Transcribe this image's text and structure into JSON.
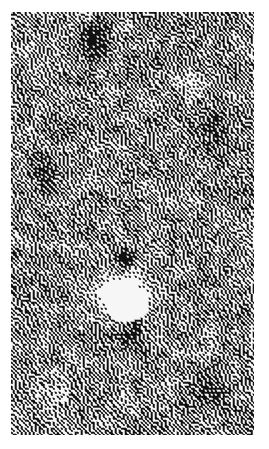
{
  "page": {
    "width": 269,
    "height": 449,
    "background_color": "#ffffff"
  },
  "plate": {
    "name": "dithered-grayscale-field",
    "x": 11,
    "y": 12,
    "width": 243,
    "height": 423,
    "description": "Coarsely dithered black-and-white halftone rendering of a noisy grayscale field",
    "ink_color": "#000000",
    "paper_color": "#ffffff",
    "dither_cell_px": 2,
    "base_level": 0.52,
    "noise": {
      "type": "value-noise",
      "octaves": 4,
      "base_scale_px": 9,
      "amplitude": 0.3,
      "grain_amplitude": 0.17,
      "seed": 20240517
    },
    "features": [
      {
        "name": "bright-source",
        "kind": "bright-blob",
        "center_x": 122,
        "center_y": 296,
        "radius_x": 23,
        "radius_y": 18,
        "core_radius_x": 15,
        "core_radius_y": 12,
        "peak_level": 1.0,
        "halo_radius": 62,
        "halo_strength": 0.26
      },
      {
        "name": "dark-streak-above-source",
        "kind": "dark-blob",
        "center_x": 124,
        "center_y": 258,
        "radius_x": 13,
        "radius_y": 11,
        "peak_level": -0.62
      },
      {
        "name": "dark-patch-upper-center",
        "kind": "dark-blob",
        "center_x": 96,
        "center_y": 40,
        "radius_x": 18,
        "radius_y": 20,
        "peak_level": -0.48
      },
      {
        "name": "dark-patch-upper-right",
        "kind": "dark-blob",
        "center_x": 212,
        "center_y": 128,
        "radius_x": 20,
        "radius_y": 22,
        "peak_level": -0.34
      },
      {
        "name": "dark-patch-left-mid",
        "kind": "dark-blob",
        "center_x": 40,
        "center_y": 176,
        "radius_x": 18,
        "radius_y": 24,
        "peak_level": -0.3
      },
      {
        "name": "dark-patch-below-source",
        "kind": "dark-blob",
        "center_x": 130,
        "center_y": 336,
        "radius_x": 22,
        "radius_y": 18,
        "peak_level": -0.36
      },
      {
        "name": "bright-patch-upper-right",
        "kind": "bright-blob",
        "center_x": 190,
        "center_y": 82,
        "radius_x": 16,
        "radius_y": 16,
        "core_radius_x": 0,
        "core_radius_y": 0,
        "peak_level": 0.3,
        "halo_radius": 0,
        "halo_strength": 0
      },
      {
        "name": "bright-patch-lower-left",
        "kind": "bright-blob",
        "center_x": 56,
        "center_y": 392,
        "radius_x": 20,
        "radius_y": 18,
        "core_radius_x": 0,
        "core_radius_y": 0,
        "peak_level": 0.22,
        "halo_radius": 0,
        "halo_strength": 0
      },
      {
        "name": "dark-patch-bottom-right",
        "kind": "dark-blob",
        "center_x": 214,
        "center_y": 392,
        "radius_x": 22,
        "radius_y": 20,
        "peak_level": -0.28
      }
    ]
  }
}
